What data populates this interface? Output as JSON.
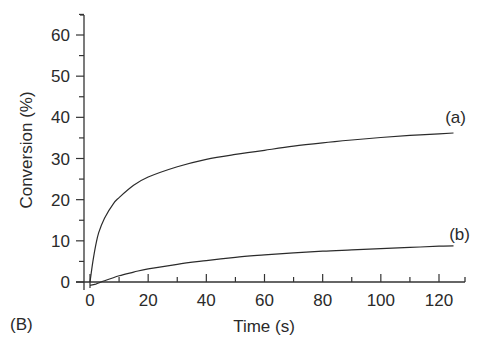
{
  "panel_label": "(B)",
  "chart_data": {
    "type": "line",
    "title": "",
    "xlabel": "Time (s)",
    "ylabel": "Conversion (%)",
    "xlim": [
      0,
      125
    ],
    "ylim": [
      -2,
      66
    ],
    "x_ticks": [
      0,
      20,
      40,
      60,
      80,
      100,
      120
    ],
    "y_ticks": [
      0,
      10,
      20,
      30,
      40,
      50,
      60
    ],
    "grid": false,
    "legend": "inline labels at line ends",
    "series": [
      {
        "name": "(a)",
        "x": [
          0,
          1,
          2,
          3,
          5,
          8,
          10,
          15,
          20,
          30,
          40,
          50,
          60,
          70,
          80,
          90,
          100,
          110,
          120,
          125
        ],
        "values": [
          0,
          5,
          9,
          12,
          15.5,
          19,
          20.5,
          23.5,
          25.5,
          28,
          29.8,
          31,
          32,
          33,
          33.8,
          34.5,
          35.1,
          35.6,
          36,
          36.2
        ]
      },
      {
        "name": "(b)",
        "x": [
          0,
          2,
          5,
          10,
          15,
          20,
          30,
          40,
          50,
          60,
          70,
          80,
          90,
          100,
          110,
          120,
          125
        ],
        "values": [
          -0.8,
          -0.5,
          0.3,
          1.5,
          2.4,
          3.2,
          4.3,
          5.2,
          6.0,
          6.6,
          7.1,
          7.5,
          7.8,
          8.1,
          8.4,
          8.7,
          8.8
        ]
      }
    ]
  }
}
